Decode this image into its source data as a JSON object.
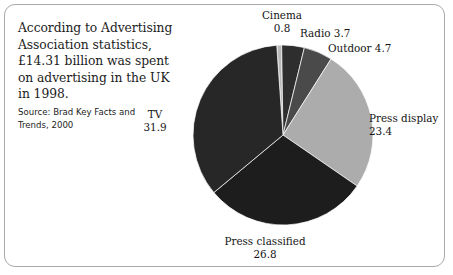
{
  "caption": {
    "lines": [
      "According to Advertising",
      "Association statistics,",
      "£14.31 billion was spent",
      "on advertising in the UK",
      "in 1998."
    ],
    "source_lines": [
      "Source: Brad Key Facts and",
      "Trends, 2000"
    ]
  },
  "chart_data": {
    "type": "pie",
    "title": "",
    "subtitle": "",
    "xlabel": "",
    "ylabel": "",
    "legend_position": "none",
    "grid": false,
    "units": "percent share of UK advertising spend, 1998",
    "total": 93.3,
    "start_angle_deg": -4,
    "direction": "clockwise",
    "categories": [
      "Cinema",
      "Radio",
      "Outdoor",
      "Press display",
      "Press classified",
      "TV"
    ],
    "values": [
      0.8,
      3.7,
      4.7,
      23.4,
      26.8,
      31.9
    ],
    "slices": [
      {
        "label": "Cinema",
        "value": 0.8,
        "value_text": "0.8",
        "color": "#b9b9b9",
        "label_id": "label-cinema"
      },
      {
        "label": "Radio",
        "value": 3.7,
        "value_text": "3.7",
        "color": "#2e2e2e",
        "label_id": "label-radio"
      },
      {
        "label": "Outdoor",
        "value": 4.7,
        "value_text": "4.7",
        "color": "#4a4a4a",
        "label_id": "label-outdoor"
      },
      {
        "label": "Press display",
        "value": 23.4,
        "value_text": "23.4",
        "color": "#acacac",
        "label_id": "label-pressdisplay"
      },
      {
        "label": "Press classified",
        "value": 26.8,
        "value_text": "26.8",
        "color": "#1d1d1d",
        "label_id": "label-pressclassified"
      },
      {
        "label": "TV",
        "value": 31.9,
        "value_text": "31.9",
        "color": "#272727",
        "label_id": "label-tv"
      }
    ],
    "geometry": {
      "center_x": 283,
      "center_y": 135,
      "radius": 90
    }
  },
  "style": {
    "frame_border_color": "#a9a9a9",
    "background": "#ffffff",
    "text_color": "#1c1c1c"
  }
}
